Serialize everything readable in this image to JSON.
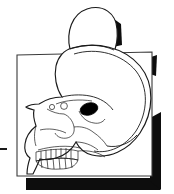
{
  "figure": {
    "title": "Lateral view line drawing of a human skull with enlarged cranium over a shadowed rectangular card",
    "background_color": "#ffffff",
    "line_color": "#1a1a1a",
    "shadow_color": "#0d0d0d",
    "frame_stroke_color": "#3a3a3a",
    "orbit_fill_color": "#000000",
    "caption": "",
    "label": ""
  },
  "card": {
    "name": "backing card",
    "fill_color": "#ffffff",
    "border_color": "#3a3a3a",
    "shadow_color": "#0d0d0d",
    "shadow_sides": "right and bottom"
  },
  "dome": {
    "name": "cranial dome protrusion",
    "fill_color": "#ffffff",
    "shadow_color": "#0d0d0d"
  },
  "skull": {
    "name": "human skull, lateral profile",
    "parts": [
      {
        "id": "cranial-vault",
        "label": "cranial vault"
      },
      {
        "id": "inner-vault-line",
        "label": "inner table of cranial vault"
      },
      {
        "id": "frontal-bone",
        "label": "frontal bone"
      },
      {
        "id": "orbit",
        "label": "orbital cavity",
        "fill_color": "#000000"
      },
      {
        "id": "nasal-aperture",
        "label": "nasal aperture"
      },
      {
        "id": "zygomatic-arch",
        "label": "zygomatic arch"
      },
      {
        "id": "maxilla",
        "label": "maxilla"
      },
      {
        "id": "mandible",
        "label": "mandible"
      },
      {
        "id": "upper-teeth",
        "label": "upper dentition"
      },
      {
        "id": "lower-teeth",
        "label": "lower dentition"
      },
      {
        "id": "occipital",
        "label": "occipital region"
      },
      {
        "id": "temporal-line",
        "label": "temporal line"
      }
    ],
    "teeth_count_upper": 8,
    "teeth_count_lower": 8
  },
  "marks": {
    "left_tick": {
      "name": "left margin tick mark",
      "color": "#1a1a1a"
    }
  }
}
